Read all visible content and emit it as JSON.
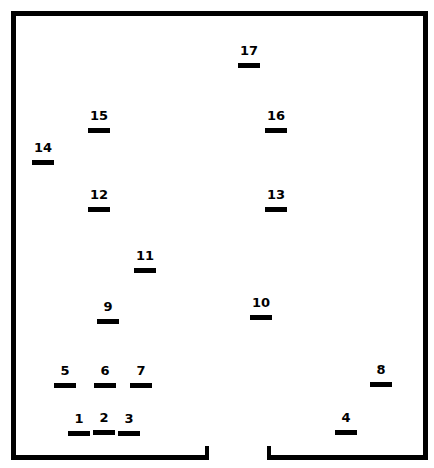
{
  "diagram": {
    "type": "floor-plan",
    "colors": {
      "wall": "#000000",
      "background": "#ffffff"
    },
    "room": {
      "left": 11,
      "top": 11,
      "right": 428,
      "bottom": 460,
      "wall_thickness": 5
    },
    "door": {
      "gap_left": 209,
      "gap_right": 267
    },
    "positions": [
      {
        "label": "1",
        "x": 68,
        "y": 431
      },
      {
        "label": "2",
        "x": 93,
        "y": 430
      },
      {
        "label": "3",
        "x": 118,
        "y": 431
      },
      {
        "label": "4",
        "x": 335,
        "y": 430
      },
      {
        "label": "5",
        "x": 54,
        "y": 383
      },
      {
        "label": "6",
        "x": 94,
        "y": 383
      },
      {
        "label": "7",
        "x": 130,
        "y": 383
      },
      {
        "label": "8",
        "x": 370,
        "y": 382
      },
      {
        "label": "9",
        "x": 97,
        "y": 319
      },
      {
        "label": "10",
        "x": 250,
        "y": 315
      },
      {
        "label": "11",
        "x": 134,
        "y": 268
      },
      {
        "label": "12",
        "x": 88,
        "y": 207
      },
      {
        "label": "13",
        "x": 265,
        "y": 207
      },
      {
        "label": "14",
        "x": 32,
        "y": 160
      },
      {
        "label": "15",
        "x": 88,
        "y": 128
      },
      {
        "label": "16",
        "x": 265,
        "y": 128
      },
      {
        "label": "17",
        "x": 238,
        "y": 63
      }
    ]
  }
}
